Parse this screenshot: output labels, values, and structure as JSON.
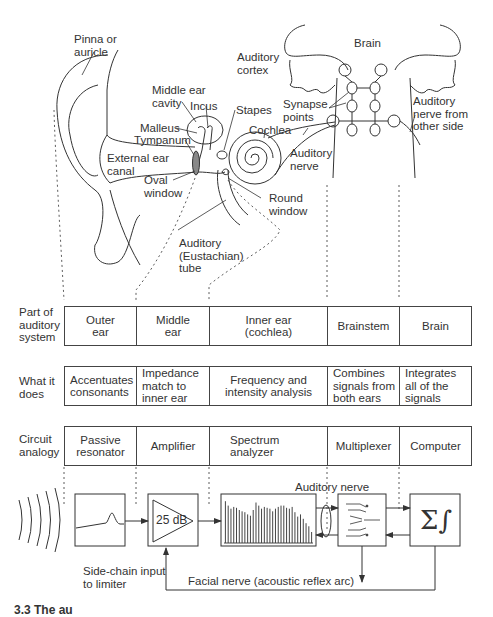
{
  "anatomy_labels": {
    "pinna": "Pinna or\nauricle",
    "auditory_cortex": "Auditory\ncortex",
    "brain": "Brain",
    "middle_ear_cavity": "Middle ear\ncavity",
    "incus": "Incus",
    "stapes": "Stapes",
    "malleus": "Malleus",
    "tympanum": "Tympanum",
    "external_ear_canal": "External ear\ncanal",
    "oval_window": "Oval\nwindow",
    "cochlea": "Cochlea",
    "synapse_points": "Synapse\npoints",
    "auditory_nerve": "Auditory\nnerve",
    "auditory_nerve_other_side": "Auditory\nnerve from\nother side",
    "round_window": "Round\nwindow",
    "eustachian_tube": "Auditory\n(Eustachian)\ntube"
  },
  "table": {
    "rows": [
      {
        "label": "Part of\nauditory\nsystem",
        "cells": [
          "Outer\near",
          "Middle\near",
          "Inner ear\n(cochlea)",
          "Brainstem",
          "Brain"
        ]
      },
      {
        "label": "What it\ndoes",
        "cells": [
          "Accentuates\nconsonants",
          "Impedance\nmatch to\ninner ear",
          "Frequency and\nintensity analysis",
          "Combines\nsignals from\nboth ears",
          "Integrates\nall of the\nsignals"
        ]
      },
      {
        "label": "Circuit\nanalogy",
        "cells": [
          "Passive\nresonator",
          "Amplifier",
          "Spectrum\nanalyzer",
          "Multiplexer",
          "Computer"
        ]
      }
    ]
  },
  "circuit": {
    "amplifier_gain": "25 dB",
    "computer_symbol": "Σ∫",
    "auditory_nerve_label": "Auditory nerve",
    "side_chain_label": "Side-chain input\nto limiter",
    "facial_nerve_label": "Facial nerve (acoustic reflex arc)",
    "spectrum_bars": [
      0.95,
      0.85,
      0.78,
      0.82,
      0.8,
      0.75,
      0.72,
      0.7,
      0.65,
      0.62,
      0.75,
      0.92,
      0.85,
      0.78,
      0.82,
      0.8,
      0.78,
      0.72,
      0.78,
      0.82,
      0.85,
      0.85,
      0.8,
      0.78,
      0.82,
      0.7,
      0.6,
      0.65,
      0.55,
      0.45,
      0.38,
      0.25
    ]
  },
  "caption_partial": "3.3 The au"
}
